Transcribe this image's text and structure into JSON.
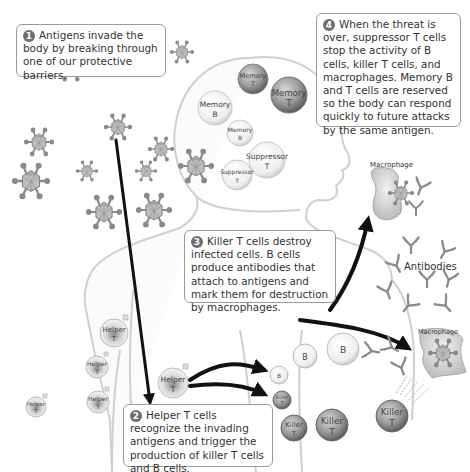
{
  "diagram": {
    "steps": [
      {
        "number": "1",
        "text": "Antigens invade the body by breaking through one of our protective barriers."
      },
      {
        "number": "2",
        "text": "Helper T cells recognize the invading antigens and trigger the production of killer T cells and B cells."
      },
      {
        "number": "3",
        "text": "Killer T cells destroy infected cells.  B cells produce antibodies that attach to antigens and mark them for destruction by macrophages."
      },
      {
        "number": "4",
        "text": "When the threat is over, suppressor T cells stop the activity of B cells, killer T cells, and macrophages. Memory B and T cells are reserved so the body can respond quickly to future attacks by the same antigen."
      }
    ],
    "labels": {
      "memory": "Memory",
      "suppressor": "Suppressor",
      "helper": "Helper",
      "killer": "Killer",
      "t": "T",
      "b": "B",
      "macrophage": "Macrophage",
      "antibodies": "Antibodies"
    },
    "colors": {
      "outline": "#cccccc",
      "callout_border": "#9a9a9a",
      "arrow": "#111111",
      "cell_light": "#f2f2f2",
      "cell_dark": "#7a7a7a",
      "antigen": "#9a9a9a"
    }
  }
}
